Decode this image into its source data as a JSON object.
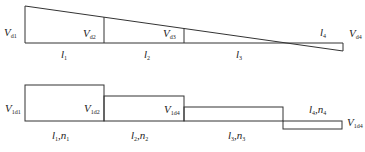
{
  "top_diagram": {
    "labels": {
      "vd1": {
        "main": "V",
        "sub": "d1"
      },
      "vd2": {
        "main": "V",
        "sub": "d2"
      },
      "vd3": {
        "main": "V",
        "sub": "d3"
      },
      "vd4": {
        "main": "V",
        "sub": "d4"
      },
      "l1": {
        "main": "l",
        "sub": "1"
      },
      "l2": {
        "main": "l",
        "sub": "2"
      },
      "l3": {
        "main": "l",
        "sub": "3"
      },
      "l4": {
        "main": "l",
        "sub": "4"
      }
    }
  },
  "bottom_diagram": {
    "labels": {
      "v1d1": {
        "main": "V",
        "sub": "1d1"
      },
      "v1d2": {
        "main": "V",
        "sub": "1d2"
      },
      "v1d4a": {
        "main": "V",
        "sub": "1d4"
      },
      "v1d4b": {
        "main": "V",
        "sub": "1d4"
      },
      "seg1": {
        "l": "l",
        "lsub": "1",
        "n": "n",
        "nsub": "1"
      },
      "seg2": {
        "l": "l",
        "lsub": "2",
        "n": "n",
        "nsub": "2"
      },
      "seg3": {
        "l": "l",
        "lsub": "3",
        "n": "n",
        "nsub": "3"
      },
      "seg4": {
        "l": "l",
        "lsub": "4",
        "n": "n",
        "nsub": "4"
      }
    }
  },
  "colors": {
    "stroke": "#333333",
    "background": "#ffffff"
  }
}
